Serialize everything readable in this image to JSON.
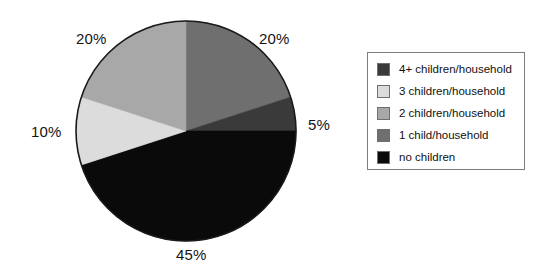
{
  "chart_data": {
    "type": "pie",
    "title": "",
    "subtitle": "",
    "xlabel": "",
    "ylabel": "",
    "grid": false,
    "legend_position": "right",
    "start_angle_deg": 0,
    "direction": "clockwise",
    "center": {
      "x": 186,
      "y": 131
    },
    "radius": 110,
    "categories": [
      "1 child/household",
      "4+ children/household",
      "no children",
      "3 children/household",
      "2 children/household"
    ],
    "values": [
      20,
      5,
      45,
      10,
      20
    ],
    "value_labels": [
      "20%",
      "5%",
      "45%",
      "10%",
      "20%"
    ],
    "colors": [
      "#6f6f6f",
      "#3a3a3a",
      "#0a0a0a",
      "#dcdcdc",
      "#a8a8a8"
    ],
    "slices": [
      {
        "label": "1 child/household",
        "value": 20,
        "value_label": "20%",
        "color": "#6f6f6f",
        "start_deg": 0,
        "end_deg": 72
      },
      {
        "label": "4+ children/household",
        "value": 5,
        "value_label": "5%",
        "color": "#3a3a3a",
        "start_deg": 72,
        "end_deg": 90
      },
      {
        "label": "no children",
        "value": 45,
        "value_label": "45%",
        "color": "#0a0a0a",
        "start_deg": 90,
        "end_deg": 252
      },
      {
        "label": "3 children/household",
        "value": 10,
        "value_label": "10%",
        "color": "#dcdcdc",
        "start_deg": 252,
        "end_deg": 288
      },
      {
        "label": "2 children/household",
        "value": 20,
        "value_label": "20%",
        "color": "#a8a8a8",
        "start_deg": 288,
        "end_deg": 360
      }
    ]
  },
  "pie": {
    "outline_color": "#1a1a1a",
    "labels": {
      "one_child": "20%",
      "two_children": "20%",
      "three_children": "10%",
      "four_plus": "5%",
      "no_children": "45%"
    }
  },
  "legend": {
    "border_color": "#7d7d7d",
    "items": [
      {
        "label": "4+ children/household",
        "color": "#3a3a3a"
      },
      {
        "label": "3 children/household",
        "color": "#dcdcdc"
      },
      {
        "label": "2 children/household",
        "color": "#a8a8a8"
      },
      {
        "label": "1 child/household",
        "color": "#6f6f6f"
      },
      {
        "label": "no children",
        "color": "#0a0a0a"
      }
    ]
  }
}
